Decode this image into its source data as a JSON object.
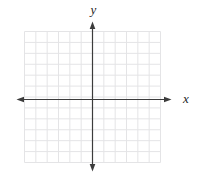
{
  "figure": {
    "kind": "empty-coordinate-plane",
    "x_label": "x",
    "y_label": "y"
  },
  "chart_data": {
    "type": "scatter",
    "title": "",
    "xlabel": "x",
    "ylabel": "y",
    "xlim": [
      -6,
      6
    ],
    "ylim": [
      -6,
      6
    ],
    "grid": "on",
    "grid_step": 1,
    "grid_columns": 12,
    "grid_rows": 12,
    "series": [],
    "annotations": []
  },
  "colors": {
    "background": "#ffffff",
    "grid_line": "#e4e4e6",
    "axis_line": "#3c3c3c",
    "label_text": "#1d1d1d"
  }
}
